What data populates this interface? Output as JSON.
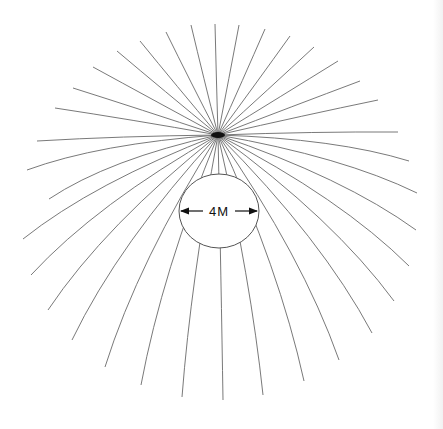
{
  "diagram": {
    "type": "radial field-line diagram",
    "convergence_point": {
      "x": 218,
      "y": 135
    },
    "circle": {
      "cx": 219,
      "cy": 211,
      "rx": 40,
      "ry": 37
    },
    "label": "4M",
    "colors": {
      "lines": "#6a6a6a",
      "text": "#111111",
      "background": "#ffffff"
    },
    "line_endpoints": [
      [
        37,
        141
      ],
      [
        55,
        108
      ],
      [
        73,
        88
      ],
      [
        93,
        67
      ],
      [
        117,
        51
      ],
      [
        140,
        41
      ],
      [
        166,
        32
      ],
      [
        191,
        25
      ],
      [
        215,
        24
      ],
      [
        239,
        25
      ],
      [
        265,
        29
      ],
      [
        290,
        36
      ],
      [
        314,
        47
      ],
      [
        338,
        61
      ],
      [
        360,
        81
      ],
      [
        378,
        100
      ],
      [
        398,
        132
      ],
      [
        409,
        161
      ],
      [
        417,
        193
      ],
      [
        416,
        230
      ],
      [
        409,
        266
      ],
      [
        394,
        301
      ],
      [
        372,
        333
      ],
      [
        339,
        360
      ],
      [
        304,
        381
      ],
      [
        263,
        395
      ],
      [
        223,
        400
      ],
      [
        182,
        397
      ],
      [
        141,
        385
      ],
      [
        105,
        367
      ],
      [
        72,
        340
      ],
      [
        48,
        310
      ],
      [
        31,
        275
      ],
      [
        23,
        239
      ],
      [
        49,
        199
      ],
      [
        27,
        170
      ]
    ]
  }
}
